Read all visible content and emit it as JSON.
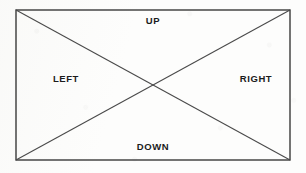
{
  "figure": {
    "stroke_color": "#3a3a3a",
    "label_color": "#1b1b1b",
    "background_color": "#fdfdfc",
    "rect": {
      "x": 16,
      "y": 10,
      "width": 274,
      "height": 150
    },
    "center": {
      "x": 153,
      "y": 85
    },
    "diagonals": [
      {
        "name": "diagonal-top-left-to-bottom-right",
        "x1": 16,
        "y1": 10,
        "x2": 290,
        "y2": 160
      },
      {
        "name": "diagonal-bottom-left-to-top-right",
        "x1": 16,
        "y1": 160,
        "x2": 290,
        "y2": 10
      }
    ],
    "labels": {
      "up": "UP",
      "left": "LEFT",
      "right": "RIGHT",
      "down": "DOWN"
    }
  }
}
